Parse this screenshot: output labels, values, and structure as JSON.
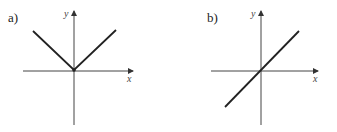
{
  "panels": [
    {
      "label": "a)",
      "x_axis": "x",
      "y_axis": "y",
      "function": "y = |x|"
    },
    {
      "label": "b)",
      "x_axis": "x",
      "y_axis": "y",
      "function": "y = x"
    }
  ]
}
